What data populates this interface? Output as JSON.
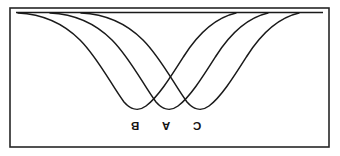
{
  "figure": {
    "title": "",
    "orientation": "rotated-180",
    "background_color": "#ffffff",
    "line_color": "#1a1a1a",
    "frame_color": "#262626"
  },
  "frame": {
    "x": 10,
    "y": 8,
    "width": 319,
    "height": 139
  },
  "labels": {
    "b": "B",
    "a": "A",
    "c": "C"
  },
  "chart_data": {
    "type": "line",
    "title": "",
    "xlabel": "",
    "ylabel": "",
    "grid": false,
    "legend_position": "none",
    "rotation_deg": 180,
    "baseline_y": 12,
    "xlim": [
      10,
      329
    ],
    "ylim": [
      8,
      147
    ],
    "annotations": [
      {
        "text": "B",
        "x": 135,
        "y": 125
      },
      {
        "text": "A",
        "x": 166,
        "y": 125
      },
      {
        "text": "C",
        "x": 197,
        "y": 125
      }
    ],
    "series": [
      {
        "name": "B",
        "label": "B",
        "minimum_x": 135,
        "minimum_y": 110,
        "depth": 98,
        "path": "M 18 13 C 40 14 62 22 80 40 C 98 58 112 86 124 102 C 130 109 138 112 146 106 C 158 97 170 78 184 56 C 198 34 214 18 236 13"
      },
      {
        "name": "A",
        "label": "A",
        "minimum_x": 166,
        "minimum_y": 110,
        "depth": 98,
        "path": "M 50 13 C 72 14 94 22 112 40 C 130 58 144 86 156 102 C 162 109 170 112 178 106 C 190 97 202 78 216 56 C 230 34 246 18 268 13"
      },
      {
        "name": "C",
        "label": "C",
        "minimum_x": 197,
        "minimum_y": 110,
        "depth": 98,
        "path": "M 81 13 C 103 14 125 22 143 40 C 161 58 175 86 187 102 C 193 109 201 112 209 106 C 221 97 233 78 247 56 C 261 34 277 18 299 13"
      }
    ]
  }
}
